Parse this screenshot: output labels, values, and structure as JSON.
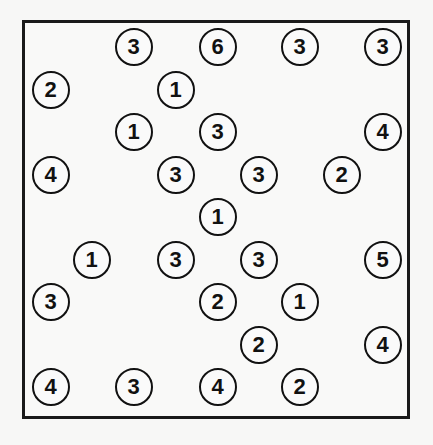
{
  "puzzle": {
    "type": "hashiwokakero",
    "grid": {
      "cols": 9,
      "rows": 9
    },
    "layout": {
      "col_x": [
        51,
        92,
        134,
        176,
        218,
        259,
        300,
        342,
        383
      ],
      "row_y": [
        47,
        90,
        132,
        175,
        217,
        260,
        302,
        345,
        387
      ]
    },
    "islands": [
      {
        "row": 0,
        "col": 2,
        "value": "3"
      },
      {
        "row": 0,
        "col": 4,
        "value": "6"
      },
      {
        "row": 0,
        "col": 6,
        "value": "3"
      },
      {
        "row": 0,
        "col": 8,
        "value": "3"
      },
      {
        "row": 1,
        "col": 0,
        "value": "2"
      },
      {
        "row": 1,
        "col": 3,
        "value": "1"
      },
      {
        "row": 2,
        "col": 2,
        "value": "1"
      },
      {
        "row": 2,
        "col": 4,
        "value": "3"
      },
      {
        "row": 2,
        "col": 8,
        "value": "4"
      },
      {
        "row": 3,
        "col": 0,
        "value": "4"
      },
      {
        "row": 3,
        "col": 3,
        "value": "3"
      },
      {
        "row": 3,
        "col": 5,
        "value": "3"
      },
      {
        "row": 3,
        "col": 7,
        "value": "2"
      },
      {
        "row": 4,
        "col": 4,
        "value": "1"
      },
      {
        "row": 5,
        "col": 1,
        "value": "1"
      },
      {
        "row": 5,
        "col": 3,
        "value": "3"
      },
      {
        "row": 5,
        "col": 5,
        "value": "3"
      },
      {
        "row": 5,
        "col": 8,
        "value": "5"
      },
      {
        "row": 6,
        "col": 0,
        "value": "3"
      },
      {
        "row": 6,
        "col": 4,
        "value": "2"
      },
      {
        "row": 6,
        "col": 6,
        "value": "1"
      },
      {
        "row": 7,
        "col": 5,
        "value": "2"
      },
      {
        "row": 7,
        "col": 8,
        "value": "4"
      },
      {
        "row": 8,
        "col": 0,
        "value": "4"
      },
      {
        "row": 8,
        "col": 2,
        "value": "3"
      },
      {
        "row": 8,
        "col": 4,
        "value": "4"
      },
      {
        "row": 8,
        "col": 6,
        "value": "2"
      }
    ]
  }
}
